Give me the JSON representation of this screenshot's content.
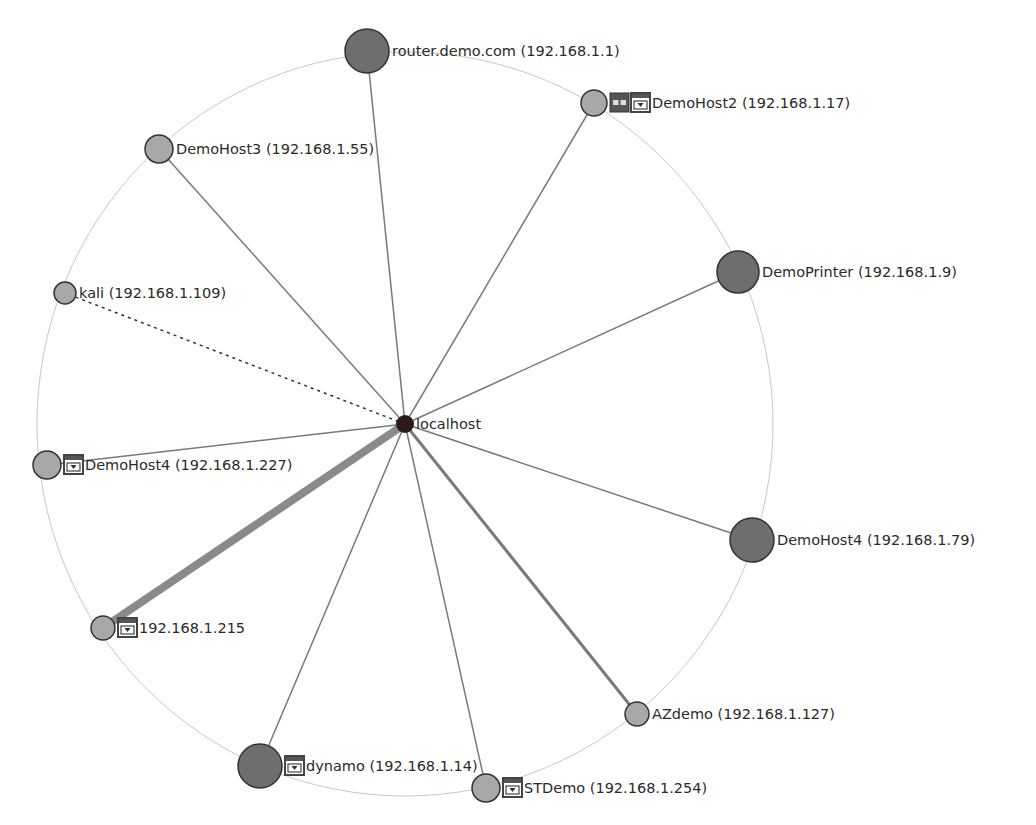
{
  "diagram": {
    "type": "network-topology-radial",
    "center": {
      "id": "localhost",
      "label": "localhost",
      "x": 405,
      "y": 424,
      "r": 9,
      "fill": "#2b1a1a"
    },
    "ring": {
      "cx": 405,
      "cy": 424,
      "rx": 368,
      "ry": 372,
      "stroke": "#c8c8c8"
    },
    "colors": {
      "node_light": "#a8a8a8",
      "node_dark": "#6e6e6e",
      "node_stroke": "#333333",
      "edge": "#7a7a7a",
      "edge_heavy": "#8a8a8a",
      "label": "#2a2a2a"
    },
    "hosts": [
      {
        "id": "router",
        "label": "router.demo.com (192.168.1.1)",
        "x": 367,
        "y": 51,
        "r": 22,
        "tone": "dark",
        "edge_width": 1.5,
        "edge_style": "solid",
        "icons": []
      },
      {
        "id": "demohost2",
        "label": "DemoHost2 (192.168.1.17)",
        "x": 594,
        "y": 103,
        "r": 13,
        "tone": "light",
        "edge_width": 1.5,
        "edge_style": "solid",
        "icons": [
          "router-icon",
          "firewall-icon"
        ]
      },
      {
        "id": "demohost3",
        "label": "DemoHost3 (192.168.1.55)",
        "x": 159,
        "y": 149,
        "r": 14,
        "tone": "light",
        "edge_width": 1.5,
        "edge_style": "solid",
        "icons": []
      },
      {
        "id": "kali",
        "label": "kali (192.168.1.109)",
        "x": 65,
        "y": 293,
        "r": 11,
        "tone": "light",
        "edge_width": 1.5,
        "edge_style": "dashed",
        "icons": []
      },
      {
        "id": "demoprinter",
        "label": "DemoPrinter (192.168.1.9)",
        "x": 738,
        "y": 272,
        "r": 21,
        "tone": "dark",
        "edge_width": 1.5,
        "edge_style": "solid",
        "icons": []
      },
      {
        "id": "demohost4-227",
        "label": "DemoHost4 (192.168.1.227)",
        "x": 47,
        "y": 465,
        "r": 14,
        "tone": "light",
        "edge_width": 1.5,
        "edge_style": "solid",
        "icons": [
          "firewall-icon"
        ]
      },
      {
        "id": "demohost4-79",
        "label": "DemoHost4 (192.168.1.79)",
        "x": 752,
        "y": 540,
        "r": 22,
        "tone": "dark",
        "edge_width": 1.5,
        "edge_style": "solid",
        "icons": []
      },
      {
        "id": "host-215",
        "label": "192.168.1.215",
        "x": 103,
        "y": 628,
        "r": 12,
        "tone": "light",
        "edge_width": 8,
        "edge_style": "solid",
        "icons": [
          "firewall-icon"
        ]
      },
      {
        "id": "azdemo",
        "label": "AZdemo (192.168.1.127)",
        "x": 637,
        "y": 714,
        "r": 12,
        "tone": "light",
        "edge_width": 3,
        "edge_style": "solid",
        "icons": []
      },
      {
        "id": "dynamo",
        "label": "dynamo (192.168.1.14)",
        "x": 260,
        "y": 766,
        "r": 22,
        "tone": "dark",
        "edge_width": 1.5,
        "edge_style": "solid",
        "icons": [
          "firewall-icon"
        ]
      },
      {
        "id": "stdemo",
        "label": "STDemo (192.168.1.254)",
        "x": 486,
        "y": 788,
        "r": 14,
        "tone": "light",
        "edge_width": 1.5,
        "edge_style": "solid",
        "icons": [
          "firewall-icon"
        ]
      }
    ]
  }
}
